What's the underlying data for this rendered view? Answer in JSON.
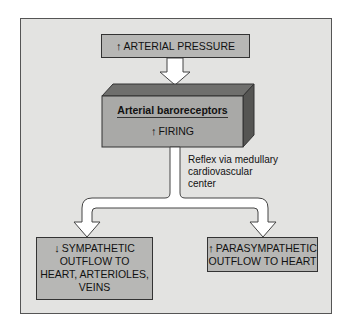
{
  "diagram": {
    "top_box": {
      "arrow": "↑",
      "arrow_icon": "up-arrow-icon",
      "label": "ARTERIAL PRESSURE"
    },
    "receptor_box": {
      "title": "Arterial baroreceptors",
      "arrow": "↑",
      "arrow_icon": "up-arrow-icon",
      "status": "FIRING"
    },
    "reflex_label": [
      "Reflex via medullary",
      "cardiovascular",
      "center"
    ],
    "left_box": {
      "arrow": "↓",
      "arrow_icon": "down-arrow-icon",
      "lines": [
        "SYMPATHETIC",
        "OUTFLOW TO",
        "HEART, ARTERIOLES,",
        "VEINS"
      ]
    },
    "right_box": {
      "arrow": "↑",
      "arrow_icon": "up-arrow-icon",
      "lines": [
        "PARASYMPATHETIC",
        "OUTFLOW TO HEART"
      ]
    },
    "colors": {
      "panel_bg": "#e3e3e1",
      "box_fill": "#b7b7b5",
      "box3d_front": "#a9a9a7",
      "box3d_top": "#6f6f6d",
      "box3d_side": "#555553",
      "arrow_fill": "#ffffff"
    }
  }
}
